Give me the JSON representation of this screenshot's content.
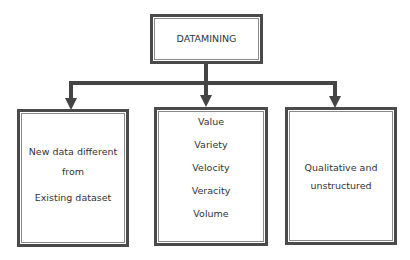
{
  "diagram": {
    "root": {
      "label": "DATAMINING"
    },
    "children": [
      {
        "lines": [
          "New data different",
          "from",
          "Existing dataset"
        ]
      },
      {
        "lines": [
          "Value",
          "Variety",
          "Velocity",
          "Veracity",
          "Volume"
        ]
      },
      {
        "lines": [
          "Qualitative and",
          "unstructured"
        ]
      }
    ],
    "colors": {
      "line": "#444444",
      "border": "#4a4a4a",
      "text": "#333333",
      "background": "#ffffff"
    }
  }
}
